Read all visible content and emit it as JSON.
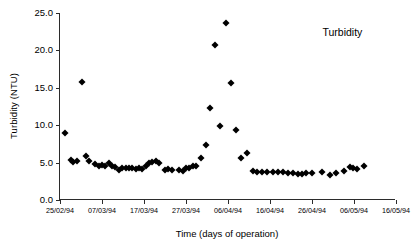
{
  "chart_data": {
    "type": "scatter",
    "title": "",
    "xlabel": "Time (days of operation)",
    "ylabel": "Turbidity (NTU)",
    "xlim": [
      0,
      80
    ],
    "ylim": [
      0.0,
      25.0
    ],
    "grid": false,
    "legend": "none",
    "annotations": [
      {
        "text": "Turbidity",
        "x": 62.5,
        "y": 22.5
      }
    ],
    "x_tick_labels": [
      "25/02/94",
      "07/03/94",
      "17/03/94",
      "27/03/94",
      "06/04/94",
      "16/04/94",
      "26/04/94",
      "06/05/94",
      "16/05/94"
    ],
    "x_tick_values": [
      0,
      10,
      20,
      30,
      40,
      50,
      60,
      70,
      80
    ],
    "y_tick_labels": [
      "0.0",
      "5.0",
      "10.0",
      "15.0",
      "20.0",
      "25.0"
    ],
    "y_tick_values": [
      0.0,
      5.0,
      10.0,
      15.0,
      20.0,
      25.0
    ],
    "marker": "diamond",
    "marker_color": "#000000",
    "series": [
      {
        "name": "Turbidity",
        "points": [
          [
            1.2,
            9.0
          ],
          [
            2.6,
            5.3
          ],
          [
            3.2,
            5.1
          ],
          [
            4.0,
            5.2
          ],
          [
            5.2,
            15.8
          ],
          [
            6.2,
            5.9
          ],
          [
            7.0,
            5.2
          ],
          [
            8.4,
            4.8
          ],
          [
            9.2,
            4.6
          ],
          [
            10.0,
            4.7
          ],
          [
            10.8,
            4.5
          ],
          [
            11.6,
            4.9
          ],
          [
            12.4,
            4.6
          ],
          [
            13.2,
            4.4
          ],
          [
            14.0,
            4.0
          ],
          [
            14.8,
            4.3
          ],
          [
            15.6,
            4.3
          ],
          [
            16.4,
            4.3
          ],
          [
            17.2,
            4.3
          ],
          [
            18.0,
            4.2
          ],
          [
            18.8,
            4.3
          ],
          [
            19.6,
            4.2
          ],
          [
            20.4,
            4.6
          ],
          [
            21.2,
            4.9
          ],
          [
            22.0,
            5.1
          ],
          [
            22.8,
            5.2
          ],
          [
            23.6,
            4.9
          ],
          [
            25.0,
            4.0
          ],
          [
            25.8,
            4.1
          ],
          [
            26.6,
            4.0
          ],
          [
            28.4,
            4.0
          ],
          [
            29.2,
            3.9
          ],
          [
            30.0,
            4.3
          ],
          [
            30.8,
            4.3
          ],
          [
            31.6,
            4.5
          ],
          [
            32.4,
            4.6
          ],
          [
            33.6,
            5.6
          ],
          [
            34.8,
            7.4
          ],
          [
            35.8,
            12.3
          ],
          [
            37.0,
            20.7
          ],
          [
            38.2,
            9.9
          ],
          [
            39.6,
            23.6
          ],
          [
            40.8,
            15.6
          ],
          [
            41.8,
            9.4
          ],
          [
            43.2,
            5.6
          ],
          [
            44.6,
            6.3
          ],
          [
            46.0,
            3.9
          ],
          [
            46.8,
            3.8
          ],
          [
            48.2,
            3.8
          ],
          [
            49.4,
            3.8
          ],
          [
            50.6,
            3.7
          ],
          [
            51.8,
            3.8
          ],
          [
            53.0,
            3.7
          ],
          [
            54.2,
            3.6
          ],
          [
            55.4,
            3.6
          ],
          [
            56.6,
            3.5
          ],
          [
            57.6,
            3.5
          ],
          [
            58.6,
            3.6
          ],
          [
            60.0,
            3.6
          ],
          [
            62.4,
            3.7
          ],
          [
            64.2,
            3.4
          ],
          [
            65.6,
            3.6
          ],
          [
            67.6,
            3.9
          ],
          [
            69.0,
            4.4
          ],
          [
            69.8,
            4.3
          ],
          [
            70.6,
            4.2
          ],
          [
            72.4,
            4.6
          ]
        ]
      }
    ]
  }
}
